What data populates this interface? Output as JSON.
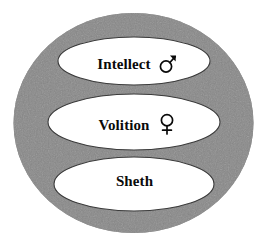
{
  "figure": {
    "type": "concentric-ellipse-diagram",
    "background_color": "#ffffff",
    "outer_ellipse": {
      "name": "outer-body-ellipse",
      "fill_color": "#808080",
      "cx": 133.5,
      "cy": 123,
      "rx": 120,
      "ry": 110,
      "texture": "scanned-halftone-noise"
    },
    "inner_ellipses": [
      {
        "key": "intellect",
        "label": "Intellect",
        "symbol": "mars-symbol",
        "symbol_char": "♂",
        "symbol_meaning": "male",
        "fill_color": "#ffffff",
        "stroke_color": "#3a3a3a",
        "cx": 134,
        "cy": 61,
        "rx": 76,
        "ry": 24
      },
      {
        "key": "volition",
        "label": "Volition",
        "symbol": "venus-symbol",
        "symbol_char": "♀",
        "symbol_meaning": "female",
        "fill_color": "#ffffff",
        "stroke_color": "#3a3a3a",
        "cx": 134,
        "cy": 122,
        "rx": 86,
        "ry": 28
      },
      {
        "key": "sheth",
        "label": "Sheth",
        "symbol": null,
        "symbol_char": "",
        "symbol_meaning": null,
        "fill_color": "#ffffff",
        "stroke_color": "#3a3a3a",
        "cx": 134,
        "cy": 184,
        "rx": 80,
        "ry": 27
      }
    ]
  },
  "labels": {
    "intellect": "Intellect",
    "volition": "Volition",
    "sheth": "Sheth"
  },
  "colors": {
    "gray_fill": "#808080",
    "white_fill": "#ffffff",
    "text": "#0a0a0a",
    "outline": "#3a3a3a"
  }
}
